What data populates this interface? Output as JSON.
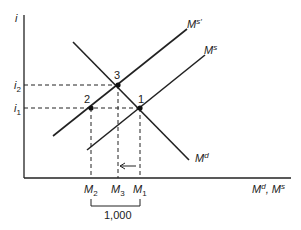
{
  "diagram": {
    "type": "money-market",
    "y_axis_label": "i",
    "x_axis_label": {
      "base1": "M",
      "sup1": "d",
      "sep": ", ",
      "base2": "M",
      "sup2": "s"
    },
    "y_ticks": [
      {
        "base": "i",
        "sub": "2"
      },
      {
        "base": "i",
        "sub": "1"
      }
    ],
    "x_ticks": [
      {
        "base": "M",
        "sub": "2"
      },
      {
        "base": "M",
        "sub": "3"
      },
      {
        "base": "M",
        "sub": "1"
      }
    ],
    "curves": [
      {
        "id": "Md",
        "base": "M",
        "sup": "d"
      },
      {
        "id": "Ms",
        "base": "M",
        "sup": "s"
      },
      {
        "id": "Ms_prime",
        "base": "M",
        "sup": "s′"
      }
    ],
    "points": [
      "1",
      "2",
      "3"
    ],
    "bracket_label": "1,000",
    "arrow": "from M1 toward M3"
  }
}
